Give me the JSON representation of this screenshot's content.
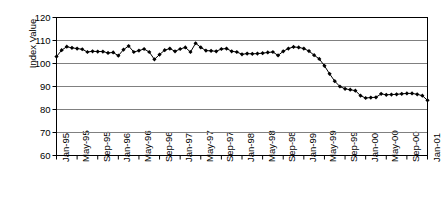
{
  "chart_data": {
    "type": "line",
    "title": "",
    "xlabel": "",
    "ylabel": "Index Value",
    "ylim": [
      60,
      120
    ],
    "ytick_values": [
      60,
      70,
      80,
      90,
      100,
      110,
      120
    ],
    "grid": true,
    "legend": "none",
    "marker": "filled-diamond",
    "line_color": "#000000",
    "marker_color": "#000000",
    "grid_color": "#808080",
    "axis_color": "#000000",
    "plot_background": "#ffffff",
    "x_tick_labels": [
      "Jan-95",
      "May-95",
      "Sep-95",
      "Jan-96",
      "May-96",
      "Sep-96",
      "Jan-97",
      "May-97",
      "Sep-97",
      "Jan-98",
      "May-98",
      "Sep-98",
      "Jan-99",
      "May-99",
      "Sep-99",
      "Jan-00",
      "May-00",
      "Sep-00",
      "Jan-01"
    ],
    "x_tick_interval_months": 4,
    "x": [
      "Jan-95",
      "Feb-95",
      "Mar-95",
      "Apr-95",
      "May-95",
      "Jun-95",
      "Jul-95",
      "Aug-95",
      "Sep-95",
      "Oct-95",
      "Nov-95",
      "Dec-95",
      "Jan-96",
      "Feb-96",
      "Mar-96",
      "Apr-96",
      "May-96",
      "Jun-96",
      "Jul-96",
      "Aug-96",
      "Sep-96",
      "Oct-96",
      "Nov-96",
      "Dec-96",
      "Jan-97",
      "Feb-97",
      "Mar-97",
      "Apr-97",
      "May-97",
      "Jun-97",
      "Jul-97",
      "Aug-97",
      "Sep-97",
      "Oct-97",
      "Nov-97",
      "Dec-97",
      "Jan-98",
      "Feb-98",
      "Mar-98",
      "Apr-98",
      "May-98",
      "Jun-98",
      "Jul-98",
      "Aug-98",
      "Sep-98",
      "Oct-98",
      "Nov-98",
      "Dec-98",
      "Jan-99",
      "Feb-99",
      "Mar-99",
      "Apr-99",
      "May-99",
      "Jun-99",
      "Jul-99",
      "Aug-99",
      "Sep-99",
      "Oct-99",
      "Nov-99",
      "Dec-99",
      "Jan-00",
      "Feb-00",
      "Mar-00",
      "Apr-00",
      "May-00",
      "Jun-00",
      "Jul-00",
      "Aug-00",
      "Sep-00",
      "Oct-00",
      "Nov-00",
      "Dec-00",
      "Jan-01"
    ],
    "values": [
      103.0,
      105.8,
      107.3,
      106.8,
      106.5,
      106.2,
      105.0,
      105.3,
      105.2,
      105.2,
      104.6,
      104.8,
      103.4,
      106.0,
      107.6,
      105.0,
      105.6,
      106.3,
      105.0,
      101.8,
      103.9,
      105.8,
      106.5,
      105.3,
      106.3,
      107.0,
      105.0,
      108.8,
      107.0,
      105.6,
      105.5,
      105.3,
      106.3,
      106.5,
      105.3,
      105.0,
      104.0,
      104.3,
      104.2,
      104.3,
      104.5,
      104.8,
      105.0,
      103.5,
      105.3,
      106.5,
      107.2,
      107.0,
      106.5,
      105.4,
      103.6,
      102.0,
      99.0,
      95.5,
      92.3,
      90.0,
      89.0,
      88.6,
      88.2,
      86.0,
      85.0,
      85.2,
      85.3,
      86.8,
      86.4,
      86.5,
      86.6,
      86.8,
      87.0,
      87.0,
      86.6,
      86.0,
      84.0
    ]
  }
}
